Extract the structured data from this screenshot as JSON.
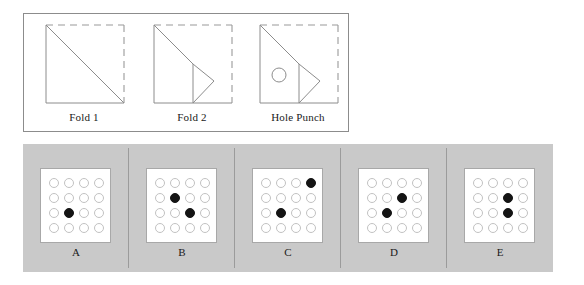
{
  "colors": {
    "panel_background": "#c9c9c9",
    "card_background": "#ffffff",
    "outline": "#8c8c8c",
    "hole_outline": "#c2c2c2",
    "hole_filled": "#141414",
    "divider": "#9b9b9b"
  },
  "fold_sequence": {
    "steps": [
      {
        "caption": "Fold 1",
        "solid_edges": [
          "left",
          "bottom"
        ],
        "dashed_edges": [
          "top",
          "right"
        ],
        "has_diagonal": true,
        "has_vertical_fold": false,
        "has_inner_triangle": false,
        "has_hole": false
      },
      {
        "caption": "Fold 2",
        "solid_edges": [
          "left",
          "bottom"
        ],
        "dashed_edges": [
          "top",
          "right"
        ],
        "has_diagonal": true,
        "has_vertical_fold": true,
        "has_inner_triangle": true,
        "has_hole": false
      },
      {
        "caption": "Hole Punch",
        "solid_edges": [
          "left",
          "bottom"
        ],
        "dashed_edges": [
          "top",
          "right"
        ],
        "has_diagonal": true,
        "has_vertical_fold": true,
        "has_inner_triangle": true,
        "has_hole": true
      }
    ]
  },
  "options": {
    "grid_rows": 4,
    "grid_cols": 4,
    "items": [
      {
        "label": "A",
        "filled": [
          [
            2,
            1
          ]
        ],
        "cells": [
          [
            0,
            0,
            0,
            0
          ],
          [
            0,
            0,
            0,
            0
          ],
          [
            0,
            1,
            0,
            0
          ],
          [
            0,
            0,
            0,
            0
          ]
        ]
      },
      {
        "label": "B",
        "filled": [
          [
            1,
            1
          ],
          [
            2,
            2
          ]
        ],
        "cells": [
          [
            0,
            0,
            0,
            0
          ],
          [
            0,
            1,
            0,
            0
          ],
          [
            0,
            0,
            1,
            0
          ],
          [
            0,
            0,
            0,
            0
          ]
        ]
      },
      {
        "label": "C",
        "filled": [
          [
            0,
            3
          ],
          [
            2,
            1
          ]
        ],
        "cells": [
          [
            0,
            0,
            0,
            1
          ],
          [
            0,
            0,
            0,
            0
          ],
          [
            0,
            1,
            0,
            0
          ],
          [
            0,
            0,
            0,
            0
          ]
        ]
      },
      {
        "label": "D",
        "filled": [
          [
            1,
            2
          ],
          [
            2,
            1
          ]
        ],
        "cells": [
          [
            0,
            0,
            0,
            0
          ],
          [
            0,
            0,
            1,
            0
          ],
          [
            0,
            1,
            0,
            0
          ],
          [
            0,
            0,
            0,
            0
          ]
        ]
      },
      {
        "label": "E",
        "filled": [
          [
            1,
            2
          ],
          [
            2,
            2
          ]
        ],
        "cells": [
          [
            0,
            0,
            0,
            0
          ],
          [
            0,
            0,
            1,
            0
          ],
          [
            0,
            0,
            1,
            0
          ],
          [
            0,
            0,
            0,
            0
          ]
        ]
      }
    ]
  }
}
